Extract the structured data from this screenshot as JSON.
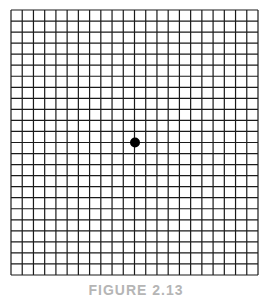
{
  "figure": {
    "type": "amsler-grid",
    "columns": 22,
    "rows": 24,
    "grid_left": 11,
    "grid_top": 10,
    "grid_right": 258,
    "grid_bottom": 275,
    "line_color": "#1a1a1a",
    "line_width": 1.2,
    "center_dot": {
      "cx": 135,
      "cy": 142.5,
      "r": 5,
      "color": "#000000"
    },
    "caption": "FIGURE 2.13"
  }
}
